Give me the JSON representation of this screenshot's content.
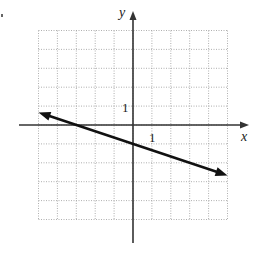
{
  "chart_data": {
    "type": "line",
    "title": "",
    "xlabel": "x",
    "ylabel": "y",
    "xlim": [
      -5,
      5
    ],
    "ylim": [
      -5,
      5
    ],
    "grid": true,
    "grid_style": "dotted",
    "tick_labels": {
      "x": "1",
      "y": "1"
    },
    "series": [
      {
        "name": "line",
        "equation": "y = -x/3 - 1",
        "slope": -0.3333,
        "intercept": -1,
        "x_intercept": -3,
        "points": [
          [
            -5,
            0.667
          ],
          [
            -3,
            0
          ],
          [
            0,
            -1
          ],
          [
            5,
            -2.667
          ]
        ],
        "arrows": "both"
      }
    ],
    "legend": null
  },
  "labels": {
    "x_axis": "x",
    "y_axis": "y",
    "x_tick": "1",
    "y_tick": "1"
  },
  "colors": {
    "grid": "#9a9a9a",
    "axis": "#333333",
    "line": "#111111"
  }
}
